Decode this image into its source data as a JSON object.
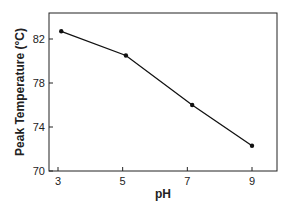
{
  "chart_data": {
    "type": "line",
    "title": "",
    "xlabel": "pH",
    "ylabel": "Peak Temperature (°C)",
    "x": [
      3.1,
      5.1,
      7.15,
      9.0
    ],
    "series": [
      {
        "name": "Peak Temperature",
        "values": [
          82.7,
          80.5,
          76.0,
          72.3
        ],
        "color": "#111111",
        "marker": "circle"
      }
    ],
    "xticks": [
      3,
      5,
      7,
      9
    ],
    "xtick_labels": [
      "3",
      "5",
      "7",
      "9"
    ],
    "yticks": [
      70,
      74,
      78,
      82
    ],
    "ytick_labels": [
      "70",
      "74",
      "78",
      "82"
    ],
    "xlim": [
      2.8,
      9.8
    ],
    "ylim": [
      70,
      85
    ],
    "grid": false,
    "legend": null
  }
}
